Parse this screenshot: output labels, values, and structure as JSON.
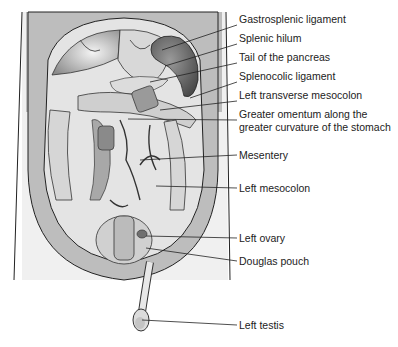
{
  "figure": {
    "labels": [
      {
        "id": "gastrosplenic-ligament",
        "text": "Gastrosplenic ligament",
        "y": 19,
        "target": [
          162,
          50
        ]
      },
      {
        "id": "splenic-hilum",
        "text": "Splenic hilum",
        "y": 38,
        "target": [
          165,
          66
        ]
      },
      {
        "id": "tail-of-pancreas",
        "text": "Tail of the pancreas",
        "y": 57,
        "target": [
          150,
          82
        ]
      },
      {
        "id": "splenocolic-ligament",
        "text": "Splenocolic ligament",
        "y": 76,
        "target": [
          190,
          98
        ]
      },
      {
        "id": "left-transverse-mesocolon",
        "text": "Left transverse mesocolon",
        "y": 95,
        "target": [
          160,
          110
        ]
      },
      {
        "id": "greater-omentum",
        "text": "Greater omentum along the",
        "text2": "greater curvature of the stomach",
        "y": 114,
        "target": [
          128,
          119
        ]
      },
      {
        "id": "mesentery",
        "text": "Mesentery",
        "y": 149,
        "target": [
          140,
          160
        ]
      },
      {
        "id": "left-mesocolon",
        "text": "Left mesocolon",
        "y": 182,
        "target": [
          156,
          186
        ]
      },
      {
        "id": "left-ovary",
        "text": "Left ovary",
        "y": 232,
        "target": [
          146,
          236
        ]
      },
      {
        "id": "douglas-pouch",
        "text": "Douglas pouch",
        "y": 255,
        "target": [
          146,
          248
        ]
      },
      {
        "id": "left-testis",
        "text": "Left testis",
        "y": 319,
        "target": [
          142,
          320
        ]
      }
    ],
    "colors": {
      "body": "#cfcfcf",
      "cavity": "#e6e6e6",
      "outline": "#222222",
      "organ_dark": "#6e6e6e",
      "organ_mid": "#b4b4b4",
      "organ_light": "#ececec"
    }
  }
}
